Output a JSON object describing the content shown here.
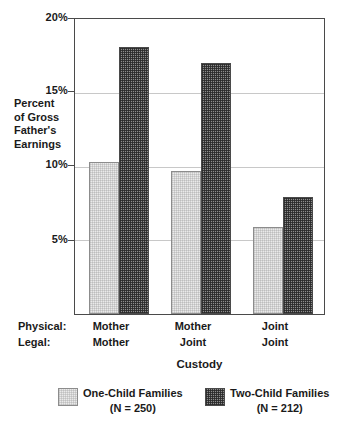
{
  "chart_data": {
    "type": "bar",
    "title": "",
    "xlabel": "Custody",
    "ylabel_lines": [
      "Percent",
      "of Gross",
      "Father's",
      "Earnings"
    ],
    "ylabel": "Percent of Gross Father's Earnings",
    "ylim": [
      0,
      20
    ],
    "yticks": [
      5,
      10,
      15,
      20
    ],
    "ytick_labels": [
      "5%",
      "10%",
      "15%",
      "20%"
    ],
    "grid": true,
    "grid_axis": "y",
    "legend_position": "bottom",
    "row_headers": [
      "Physical:",
      "Legal:"
    ],
    "categories": [
      {
        "physical": "Mother",
        "legal": "Mother"
      },
      {
        "physical": "Mother",
        "legal": "Joint"
      },
      {
        "physical": "Joint",
        "legal": "Joint"
      }
    ],
    "category_labels": [
      "Mother / Mother",
      "Mother / Joint",
      "Joint / Joint"
    ],
    "series": [
      {
        "name": "One-Child Families",
        "n_label": "(N = 250)",
        "n": 250,
        "fill": "light-hatch",
        "color": "#eaeaea",
        "values": [
          10.3,
          9.7,
          5.9
        ]
      },
      {
        "name": "Two-Child Families",
        "n_label": "(N = 212)",
        "n": 212,
        "fill": "dark-hatch",
        "color": "#555555",
        "values": [
          18.1,
          17.0,
          7.9
        ]
      }
    ]
  },
  "axis": {
    "ytick_labels": [
      "20%",
      "15%",
      "10%",
      "5%"
    ]
  },
  "legend": {
    "items": [
      {
        "label": "One-Child Families",
        "sub": "(N = 250)"
      },
      {
        "label": "Two-Child Families",
        "sub": "(N = 212)"
      }
    ]
  },
  "colors": {
    "frame": "#4a4a4a",
    "grid": "#c8c8c8",
    "text": "#1a1a1a",
    "light_bar": "#eaeaea",
    "dark_bar": "#555555",
    "background": "#ffffff"
  }
}
